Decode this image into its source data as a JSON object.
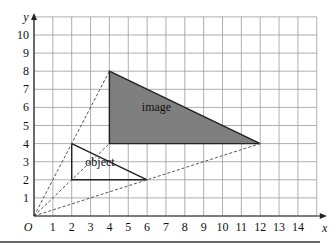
{
  "diagram": {
    "type": "enlargement",
    "axes": {
      "x_label": "x",
      "y_label": "y",
      "origin_label": "O",
      "x_ticks": [
        "1",
        "2",
        "3",
        "4",
        "5",
        "6",
        "7",
        "8",
        "9",
        "10",
        "11",
        "12",
        "13",
        "14"
      ],
      "y_ticks": [
        "1",
        "2",
        "3",
        "4",
        "5",
        "6",
        "7",
        "8",
        "9",
        "10"
      ],
      "x_range": [
        0,
        15
      ],
      "y_range": [
        0,
        11
      ],
      "grid": true
    },
    "object": {
      "label": "object",
      "vertices": [
        [
          2,
          2
        ],
        [
          2,
          4
        ],
        [
          6,
          2
        ]
      ],
      "fill": "none"
    },
    "image": {
      "label": "image",
      "vertices": [
        [
          4,
          4
        ],
        [
          4,
          8
        ],
        [
          12,
          4
        ]
      ],
      "fill": "#7f7f7f"
    },
    "construction_lines": [
      {
        "from": [
          0,
          0
        ],
        "to": [
          4,
          8
        ]
      },
      {
        "from": [
          0,
          0
        ],
        "to": [
          4,
          4
        ]
      },
      {
        "from": [
          0,
          0
        ],
        "to": [
          12,
          4
        ]
      }
    ],
    "colors": {
      "grid": "#9a9a9a",
      "axes": "#222222",
      "image_fill": "#7f7f7f",
      "outline": "#222222",
      "dashed": "#555555"
    }
  }
}
